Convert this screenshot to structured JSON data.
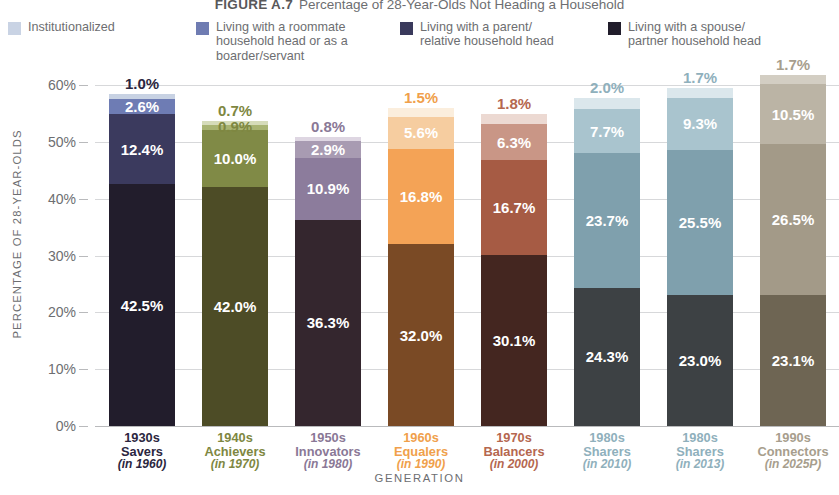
{
  "figure": {
    "number": "FIGURE A.7",
    "title": "Percentage of 28-Year-Olds Not Heading a Household"
  },
  "legend": {
    "items": [
      {
        "label": "Institutionalized",
        "color": "#c9d3e4"
      },
      {
        "label": "Living with a roommate\nhousehold head or as a\nboarder/servant",
        "color": "#6f7cb2"
      },
      {
        "label": "Living with a parent/\nrelative household head",
        "color": "#3a3a5c"
      },
      {
        "label": "Living with a spouse/\npartner household head",
        "color": "#211d2b"
      }
    ]
  },
  "axes": {
    "y_title": "PERCENTAGE OF 28-YEAR-OLDS",
    "x_title": "GENERATION",
    "y_ticks": [
      "60%",
      "50%",
      "40%",
      "30%",
      "20%",
      "10%",
      "0%"
    ]
  },
  "chart_data": {
    "type": "bar",
    "subtype": "stacked-vertical",
    "title": "Percentage of 28-Year-Olds Not Heading a Household",
    "xlabel": "GENERATION",
    "ylabel": "PERCENTAGE OF 28-YEAR-OLDS",
    "ylim": [
      0,
      60
    ],
    "ytick_values": [
      0,
      10,
      20,
      30,
      40,
      50,
      60
    ],
    "grid": true,
    "legend_position": "top",
    "series": [
      {
        "name": "Living with a spouse/partner household head",
        "values": [
          42.5,
          42.0,
          36.3,
          32.0,
          30.1,
          24.3,
          23.0,
          23.1
        ]
      },
      {
        "name": "Living with a parent/relative household head",
        "values": [
          12.4,
          10.0,
          10.9,
          16.8,
          16.7,
          23.7,
          25.5,
          26.5
        ]
      },
      {
        "name": "Living with a roommate household head or as a boarder/servant",
        "values": [
          2.6,
          0.9,
          2.9,
          5.6,
          6.3,
          7.7,
          9.3,
          10.5
        ]
      },
      {
        "name": "Institutionalized",
        "values": [
          1.0,
          0.7,
          0.8,
          1.5,
          1.8,
          2.0,
          1.7,
          1.7
        ]
      }
    ],
    "categories": [
      {
        "decade": "1930s",
        "name": "Savers",
        "period": "(in 1960)",
        "color": "#2b2640"
      },
      {
        "decade": "1940s",
        "name": "Achievers",
        "period": "(in 1970)",
        "color": "#7e8741"
      },
      {
        "decade": "1950s",
        "name": "Innovators",
        "period": "(in 1980)",
        "color": "#8a7896"
      },
      {
        "decade": "1960s",
        "name": "Equalers",
        "period": "(in 1990)",
        "color": "#f0a04b"
      },
      {
        "decade": "1970s",
        "name": "Balancers",
        "period": "(in 2000)",
        "color": "#b5674f"
      },
      {
        "decade": "1980s",
        "name": "Sharers",
        "period": "(in 2010)",
        "color": "#8fb0bc"
      },
      {
        "decade": "1980s",
        "name": "Sharers",
        "period": "(in 2013)",
        "color": "#8fb0bc"
      },
      {
        "decade": "1990s",
        "name": "Connectors",
        "period": "(in 2025P)",
        "color": "#a79e8d"
      }
    ]
  },
  "bars": [
    {
      "id": "1930s",
      "label_color": "#2b2640",
      "decade": "1930s",
      "name": "Savers",
      "period": "(in 1960)",
      "segments": [
        {
          "key": "spouse",
          "value": 42.5,
          "text": "42.5%",
          "color": "#221d2c",
          "text_color": "#ffffff",
          "show": true
        },
        {
          "key": "parent",
          "value": 12.4,
          "text": "12.4%",
          "color": "#3b3a5e",
          "text_color": "#ffffff",
          "show": true
        },
        {
          "key": "roommate",
          "value": 2.6,
          "text": "2.6%",
          "color": "#6e7cb4",
          "text_color": "#ffffff",
          "show": true
        },
        {
          "key": "inst",
          "value": 1.0,
          "text": "1.0%",
          "color": "#c8d2e3",
          "text_color": "#2b2640",
          "show": false
        }
      ],
      "top_label": "1.0%"
    },
    {
      "id": "1940s",
      "label_color": "#7e8741",
      "decade": "1940s",
      "name": "Achievers",
      "period": "(in 1970)",
      "segments": [
        {
          "key": "spouse",
          "value": 42.0,
          "text": "42.0%",
          "color": "#4d4c26",
          "text_color": "#ffffff",
          "show": true
        },
        {
          "key": "parent",
          "value": 10.0,
          "text": "10.0%",
          "color": "#808a46",
          "text_color": "#ffffff",
          "show": true
        },
        {
          "key": "roommate",
          "value": 0.9,
          "text": "0.9%",
          "color": "#a9b473",
          "text_color": "#7e8741",
          "show": false
        },
        {
          "key": "inst",
          "value": 0.7,
          "text": "0.7%",
          "color": "#d6dcba",
          "text_color": "#7e8741",
          "show": false
        }
      ],
      "top_label": "0.7%",
      "top_label2": "0.9%"
    },
    {
      "id": "1950s",
      "label_color": "#8a7896",
      "decade": "1950s",
      "name": "Innovators",
      "period": "(in 1980)",
      "segments": [
        {
          "key": "spouse",
          "value": 36.3,
          "text": "36.3%",
          "color": "#34262e",
          "text_color": "#ffffff",
          "show": true
        },
        {
          "key": "parent",
          "value": 10.9,
          "text": "10.9%",
          "color": "#8c7c9c",
          "text_color": "#ffffff",
          "show": true
        },
        {
          "key": "roommate",
          "value": 2.9,
          "text": "2.9%",
          "color": "#a89bb2",
          "text_color": "#ffffff",
          "show": true
        },
        {
          "key": "inst",
          "value": 0.8,
          "text": "0.8%",
          "color": "#ded6e2",
          "text_color": "#8a7896",
          "show": false
        }
      ],
      "top_label": "0.8%"
    },
    {
      "id": "1960s",
      "label_color": "#f0a04b",
      "decade": "1960s",
      "name": "Equalers",
      "period": "(in 1990)",
      "segments": [
        {
          "key": "spouse",
          "value": 32.0,
          "text": "32.0%",
          "color": "#7a4a25",
          "text_color": "#ffffff",
          "show": true
        },
        {
          "key": "parent",
          "value": 16.8,
          "text": "16.8%",
          "color": "#f4a356",
          "text_color": "#ffffff",
          "show": true
        },
        {
          "key": "roommate",
          "value": 5.6,
          "text": "5.6%",
          "color": "#f6cda0",
          "text_color": "#ffffff",
          "show": true
        },
        {
          "key": "inst",
          "value": 1.5,
          "text": "1.5%",
          "color": "#fbeedd",
          "text_color": "#f0a04b",
          "show": false
        }
      ],
      "top_label": "1.5%"
    },
    {
      "id": "1970s",
      "label_color": "#b5674f",
      "decade": "1970s",
      "name": "Balancers",
      "period": "(in 2000)",
      "segments": [
        {
          "key": "spouse",
          "value": 30.1,
          "text": "30.1%",
          "color": "#442620",
          "text_color": "#ffffff",
          "show": true
        },
        {
          "key": "parent",
          "value": 16.7,
          "text": "16.7%",
          "color": "#a65b44",
          "text_color": "#ffffff",
          "show": true
        },
        {
          "key": "roommate",
          "value": 6.3,
          "text": "6.3%",
          "color": "#c99686",
          "text_color": "#ffffff",
          "show": true
        },
        {
          "key": "inst",
          "value": 1.8,
          "text": "1.8%",
          "color": "#ecd9d2",
          "text_color": "#b5674f",
          "show": false
        }
      ],
      "top_label": "1.8%"
    },
    {
      "id": "1980s-2010",
      "label_color": "#8fb0bc",
      "decade": "1980s",
      "name": "Sharers",
      "period": "(in 2010)",
      "segments": [
        {
          "key": "spouse",
          "value": 24.3,
          "text": "24.3%",
          "color": "#3d4144",
          "text_color": "#ffffff",
          "show": true
        },
        {
          "key": "parent",
          "value": 23.7,
          "text": "23.7%",
          "color": "#7fa0ad",
          "text_color": "#ffffff",
          "show": true
        },
        {
          "key": "roommate",
          "value": 7.7,
          "text": "7.7%",
          "color": "#a9c4ce",
          "text_color": "#ffffff",
          "show": true
        },
        {
          "key": "inst",
          "value": 2.0,
          "text": "2.0%",
          "color": "#dbe7ec",
          "text_color": "#8fb0bc",
          "show": false
        }
      ],
      "top_label": "2.0%"
    },
    {
      "id": "1980s-2013",
      "label_color": "#8fb0bc",
      "decade": "1980s",
      "name": "Sharers",
      "period": "(in 2013)",
      "segments": [
        {
          "key": "spouse",
          "value": 23.0,
          "text": "23.0%",
          "color": "#3d4144",
          "text_color": "#ffffff",
          "show": true
        },
        {
          "key": "parent",
          "value": 25.5,
          "text": "25.5%",
          "color": "#7fa0ad",
          "text_color": "#ffffff",
          "show": true
        },
        {
          "key": "roommate",
          "value": 9.3,
          "text": "9.3%",
          "color": "#a9c4ce",
          "text_color": "#ffffff",
          "show": true
        },
        {
          "key": "inst",
          "value": 1.7,
          "text": "1.7%",
          "color": "#dbe7ec",
          "text_color": "#8fb0bc",
          "show": false
        }
      ],
      "top_label": "1.7%"
    },
    {
      "id": "1990s",
      "label_color": "#a79e8d",
      "decade": "1990s",
      "name": "Connectors",
      "period": "(in 2025P)",
      "segments": [
        {
          "key": "spouse",
          "value": 23.1,
          "text": "23.1%",
          "color": "#6e6553",
          "text_color": "#ffffff",
          "show": true
        },
        {
          "key": "parent",
          "value": 26.5,
          "text": "26.5%",
          "color": "#a39a88",
          "text_color": "#ffffff",
          "show": true
        },
        {
          "key": "roommate",
          "value": 10.5,
          "text": "10.5%",
          "color": "#bbb4a5",
          "text_color": "#ffffff",
          "show": true
        },
        {
          "key": "inst",
          "value": 1.7,
          "text": "1.7%",
          "color": "#d3cec3",
          "text_color": "#8f8778",
          "show": false
        }
      ],
      "top_label": "1.7%"
    }
  ]
}
